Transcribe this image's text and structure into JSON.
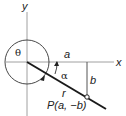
{
  "diagram": {
    "title": "",
    "axes": {
      "x_label": "x",
      "y_label": "y",
      "axis_color": "#9a9a9a"
    },
    "labels": {
      "theta": "θ",
      "alpha": "α",
      "a": "a",
      "b": "b",
      "r": "r",
      "point": "P(a, −b)"
    },
    "colors": {
      "line": "#1a1a1a",
      "circle": "#333333",
      "text": "#222222",
      "background": "#ffffff"
    }
  }
}
